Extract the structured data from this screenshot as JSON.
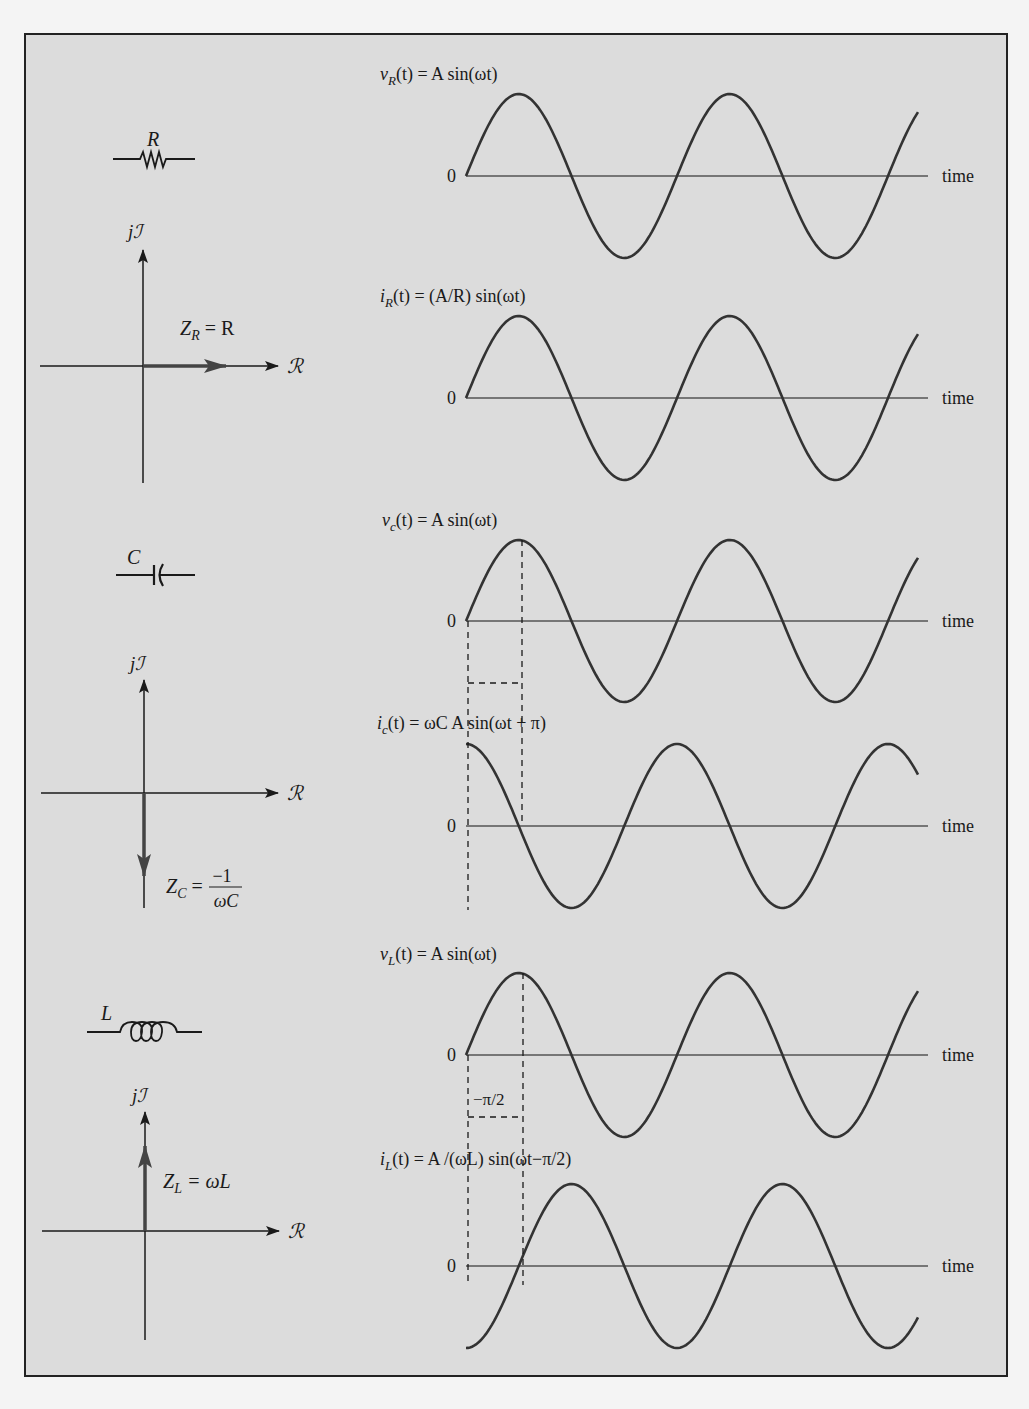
{
  "figure": {
    "background": "#dcdcdc",
    "border_color": "#222222",
    "wave_color": "#333333",
    "axis_color": "#555555"
  },
  "components": [
    {
      "id": "resistor",
      "symbol_label": "R",
      "phasor": {
        "axis_imag": "jℐ",
        "axis_real": "ℛ",
        "impedance_label": "Z_R = R",
        "direction": "right"
      },
      "voltage": {
        "label": "v_R(t) = A sin(ωt)",
        "zero_label": "0",
        "time_label": "time",
        "phase": 0
      },
      "current": {
        "label": "i_R(t) = (A/R) sin(ωt)",
        "zero_label": "0",
        "time_label": "time",
        "phase": 0
      }
    },
    {
      "id": "capacitor",
      "symbol_label": "C",
      "phasor": {
        "axis_imag": "jℐ",
        "axis_real": "ℛ",
        "impedance_label": "Z_C =",
        "impedance_num": "−1",
        "impedance_den": "ωC",
        "direction": "down"
      },
      "voltage": {
        "label": "v_c(t) = A sin(ωt)",
        "zero_label": "0",
        "time_label": "time",
        "phase": 0
      },
      "current": {
        "label": "i_c(t) = ωC A sin(ωt + π)",
        "zero_label": "0",
        "time_label": "time",
        "phase": "π/2"
      }
    },
    {
      "id": "inductor",
      "symbol_label": "L",
      "phasor": {
        "axis_imag": "jℐ",
        "axis_real": "ℛ",
        "impedance_label": "Z_L = ωL",
        "direction": "up"
      },
      "voltage": {
        "label": "v_L(t) = A sin(ωt)",
        "zero_label": "0",
        "time_label": "time",
        "phase": 0,
        "phase_marker": "−π/2"
      },
      "current": {
        "label": "i_L(t) = A /(ωL) sin(ωt−π/2)",
        "zero_label": "0",
        "time_label": "time",
        "phase": "−π/2"
      }
    }
  ],
  "labels": {
    "vR_main": "v",
    "vR_sub": "R",
    "vR_rest": "(t) = A sin(ωt)",
    "iR_main": "i",
    "iR_sub": "R",
    "iR_rest": "(t) = (A/R) sin(ωt)",
    "vC_main": "v",
    "vC_sub": "c",
    "vC_rest": "(t) = A sin(ωt)",
    "iC_main": "i",
    "iC_sub": "c",
    "iC_rest": "(t) = ωC A sin(ωt + π)",
    "vL_main": "v",
    "vL_sub": "L",
    "vL_rest": "(t) = A sin(ωt)",
    "iL_main": "i",
    "iL_sub": "L",
    "iL_rest": "(t) = A /(ωL) sin(ωt−π/2)",
    "zero": "0",
    "time": "time",
    "jI": "jℐ",
    "Re": "ℛ",
    "R": "R",
    "C": "C",
    "L": "L",
    "ZR_Z": "Z",
    "ZR_sub": "R",
    "ZR_rest": " = R",
    "ZC_Z": "Z",
    "ZC_sub": "C",
    "ZC_eq": " =",
    "ZC_num": "−1",
    "ZC_den": "ωC",
    "ZL_Z": "Z",
    "ZL_sub": "L",
    "ZL_rest": " = ωL",
    "minus_pi_2": "−π/2"
  }
}
